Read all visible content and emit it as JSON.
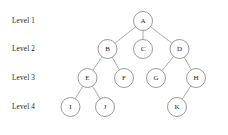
{
  "diagram": {
    "type": "tree",
    "background_color": "#ffffff",
    "node_fill_color": "#ffffff",
    "node_stroke_color": "#6f6f6f",
    "edge_color": "#8a8a8a",
    "text_color": "#1a1a1a",
    "node_radius": 9.5
  },
  "level_labels": [
    {
      "text": "Level 1",
      "x": 12,
      "y": 21
    },
    {
      "text": "Level 2",
      "x": 12,
      "y": 49
    },
    {
      "text": "Level 3",
      "x": 12,
      "y": 78
    },
    {
      "text": "Level 4",
      "x": 12,
      "y": 107
    }
  ],
  "nodes": [
    {
      "id": "A",
      "label": "A",
      "level": 1,
      "x": 143,
      "y": 21
    },
    {
      "id": "B",
      "label": "B",
      "level": 2,
      "x": 107.5,
      "y": 49
    },
    {
      "id": "C",
      "label": "C",
      "level": 2,
      "x": 143,
      "y": 49
    },
    {
      "id": "D",
      "label": "D",
      "level": 2,
      "x": 179.5,
      "y": 49
    },
    {
      "id": "E",
      "label": "E",
      "level": 3,
      "x": 87.5,
      "y": 78
    },
    {
      "id": "F",
      "label": "F",
      "level": 3,
      "x": 124,
      "y": 78
    },
    {
      "id": "G",
      "label": "G",
      "level": 3,
      "x": 156,
      "y": 78
    },
    {
      "id": "H",
      "label": "H",
      "level": 3,
      "x": 196,
      "y": 78
    },
    {
      "id": "I",
      "label": "I",
      "level": 4,
      "x": 70.5,
      "y": 107
    },
    {
      "id": "J",
      "label": "J",
      "level": 4,
      "x": 105,
      "y": 107
    },
    {
      "id": "K",
      "label": "K",
      "level": 4,
      "x": 177,
      "y": 107
    }
  ],
  "edges": [
    {
      "from": "A",
      "to": "B"
    },
    {
      "from": "A",
      "to": "C"
    },
    {
      "from": "A",
      "to": "D"
    },
    {
      "from": "B",
      "to": "E"
    },
    {
      "from": "B",
      "to": "F"
    },
    {
      "from": "D",
      "to": "G"
    },
    {
      "from": "D",
      "to": "H"
    },
    {
      "from": "E",
      "to": "I"
    },
    {
      "from": "E",
      "to": "J"
    },
    {
      "from": "H",
      "to": "K"
    }
  ]
}
